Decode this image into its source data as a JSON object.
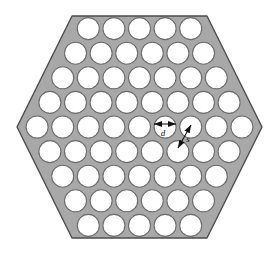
{
  "figure": {
    "name": "hexagonal-perforated-plate",
    "shape": "regular hexagon (flat-left/right vertices, horizontal top and bottom edges)",
    "hole_count": 61,
    "hole_shape": "circle",
    "packing": "triangular / hexagonal close pattern",
    "rows_hole_counts": [
      5,
      6,
      7,
      8,
      9,
      8,
      7,
      6,
      5
    ],
    "row_count": 9
  },
  "colors": {
    "plate_fill": "#a8a8a8",
    "plate_stroke": "#4d4d4d",
    "hole_fill": "#ffffff",
    "hole_stroke": "#6b6b6b",
    "annotation": "#111111",
    "background": "#ffffff"
  },
  "geometry": {
    "hex_center_x": 139.5,
    "hex_center_y": 127,
    "hex_left_vertex_x": 17,
    "hex_right_vertex_x": 262,
    "hex_top_edge_y": 16,
    "hex_bottom_edge_y": 238,
    "hex_top_edge_left_x": 72,
    "hex_top_edge_right_x": 207,
    "hole_radius": 11,
    "pitch_x": 25.6,
    "pitch_y": 24.6
  },
  "annotations": {
    "diameter": {
      "symbol": "d",
      "meaning": "hole diameter",
      "arrow": "double-headed horizontal arrow across one hole",
      "x1": 154,
      "y1": 124,
      "x2": 176,
      "y2": 124,
      "label_x": 163,
      "label_y": 136
    },
    "pitch": {
      "symbol": "s",
      "meaning": "centre-to-centre hole pitch",
      "arrow": "double-headed diagonal arrow between two adjacent hole centres",
      "x1": 178,
      "y1": 148,
      "x2": 191,
      "y2": 125,
      "label_x": 188,
      "label_y": 142
    }
  },
  "chart_data": {
    "type": "scatter",
    "xlabel": "",
    "ylabel": "",
    "categories": [
      "row 1",
      "row 2",
      "row 3",
      "row 4",
      "row 5",
      "row 6",
      "row 7",
      "row 8",
      "row 9"
    ],
    "values": [
      5,
      6,
      7,
      8,
      9,
      8,
      7,
      6,
      5
    ],
    "series": [
      {
        "name": "holes per row",
        "values": [
          5,
          6,
          7,
          8,
          9,
          8,
          7,
          6,
          5
        ]
      }
    ],
    "total": 61,
    "grid": false,
    "legend": "none"
  }
}
